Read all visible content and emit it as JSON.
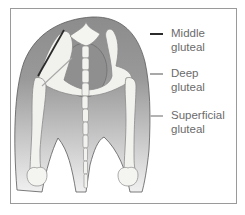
{
  "diagram": {
    "colors": {
      "muscle_top": "#8c8c8c",
      "muscle_bottom": "#e9e9e9",
      "bone": "#f1f1ee",
      "bone_outline": "#8a8a8a",
      "frame": "#9a9a9a"
    }
  },
  "legend": {
    "items": [
      {
        "label": "Middle\ngluteal",
        "color": "#2b2b2b",
        "icon": "dark-line"
      },
      {
        "label": "Deep\ngluteal",
        "color": "#a8a8a8",
        "icon": "grey-line"
      },
      {
        "label": "Superficial\ngluteal",
        "color": "#b3b3b3",
        "icon": "light-line"
      }
    ]
  }
}
